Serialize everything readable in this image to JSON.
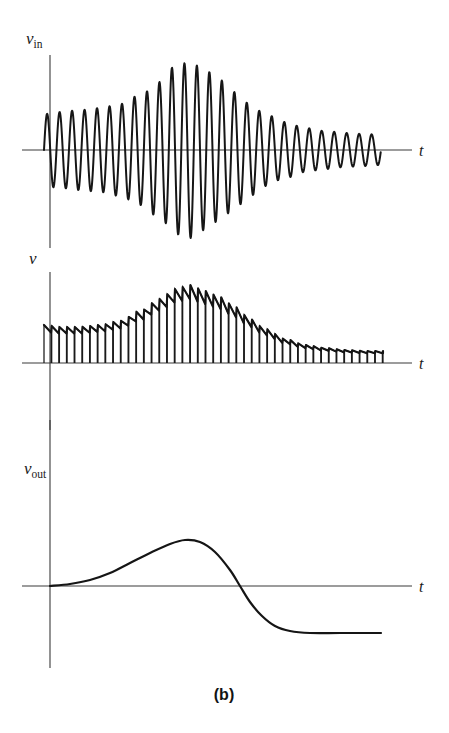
{
  "figure": {
    "caption": "(b)",
    "background_color": "#ffffff",
    "stroke_color": "#161616",
    "axis_color": "#3a3a3a"
  },
  "panels": [
    {
      "id": "input",
      "ylabel_main": "v",
      "ylabel_sub": "in",
      "xlabel": "t",
      "description": "Amplitude-modulated input signal with rising and falling envelope"
    },
    {
      "id": "detected",
      "ylabel_main": "v",
      "ylabel_sub": "",
      "xlabel": "t",
      "description": "Rectified sampled signal following the envelope of the input"
    },
    {
      "id": "output",
      "ylabel_main": "v",
      "ylabel_sub": "out",
      "xlabel": "t",
      "description": "Smoothed differentiated output rising to a peak then settling below zero"
    }
  ],
  "chart_data": [
    {
      "type": "line",
      "title": "",
      "xlabel": "t",
      "ylabel": "v_in",
      "axis_origin_x": 50,
      "baseline_y": 150,
      "y_axis_top": 55,
      "y_axis_bottom": 248,
      "x_axis_end": 412,
      "signal_start_x": 44,
      "signal_end_x": 381,
      "cycles": 27,
      "envelope_x": [
        44,
        60,
        80,
        100,
        120,
        140,
        160,
        175,
        190,
        205,
        220,
        235,
        250,
        265,
        285,
        305,
        325,
        345,
        365,
        381
      ],
      "envelope_amplitude": [
        36,
        38,
        40,
        42,
        46,
        55,
        68,
        84,
        88,
        80,
        70,
        58,
        46,
        36,
        28,
        22,
        19,
        17,
        16,
        15
      ],
      "grid": false,
      "legend": "none"
    },
    {
      "type": "line",
      "title": "",
      "xlabel": "t",
      "ylabel": "v",
      "axis_origin_x": 50,
      "baseline_y": 363,
      "y_axis_top": 272,
      "y_axis_bottom": 430,
      "x_axis_end": 412,
      "signal_start_x": 44,
      "signal_end_x": 383,
      "pulse_count": 44,
      "envelope_x": [
        44,
        60,
        80,
        100,
        120,
        140,
        160,
        175,
        190,
        205,
        220,
        235,
        250,
        265,
        285,
        305,
        325,
        345,
        365,
        383
      ],
      "envelope_amplitude": [
        38,
        36,
        36,
        38,
        42,
        52,
        64,
        74,
        78,
        72,
        66,
        56,
        44,
        34,
        24,
        18,
        15,
        13,
        12,
        12
      ],
      "droop_fraction": 0.18,
      "grid": false,
      "legend": "none"
    },
    {
      "type": "line",
      "title": "",
      "xlabel": "t",
      "ylabel": "v_out",
      "axis_origin_x": 50,
      "baseline_y": 586,
      "y_axis_top": 420,
      "y_axis_bottom": 668,
      "x_axis_end": 412,
      "curve_points_x": [
        50,
        70,
        90,
        110,
        130,
        150,
        170,
        185,
        200,
        215,
        230,
        240,
        250,
        262,
        275,
        290,
        310,
        340,
        381
      ],
      "curve_points_y": [
        586,
        584,
        580,
        573,
        563,
        553,
        544,
        540,
        542,
        552,
        570,
        586,
        602,
        616,
        626,
        631,
        633,
        633,
        633
      ],
      "zero_crossing_x": 240,
      "peak_x": 185,
      "peak_y": 540,
      "asymptote_y": 633,
      "grid": false,
      "legend": "none"
    }
  ]
}
